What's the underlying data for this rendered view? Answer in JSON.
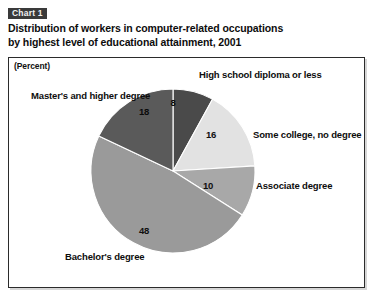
{
  "header": {
    "chart_number": "Chart 1",
    "title_line_1": "Distribution of workers in computer-related occupations",
    "title_line_2": "by highest level of educational attainment, 2001"
  },
  "plot": {
    "unit_label": "(Percent)"
  },
  "chart_data": {
    "type": "pie",
    "title": "Distribution of workers in computer-related occupations by highest level of educational attainment, 2001",
    "subtitle": "Chart 1",
    "unit": "(Percent)",
    "categories": [
      "High school diploma or less",
      "Some college, no degree",
      "Associate degree",
      "Bachelor's degree",
      "Master's and higher degree"
    ],
    "values": [
      8,
      16,
      10,
      48,
      18
    ],
    "value_labels": [
      "8",
      "16",
      "10",
      "48",
      "18"
    ],
    "colors": [
      "#4a4a4a",
      "#e2e2e2",
      "#a8a8a8",
      "#9a9a9a",
      "#5a5a5a"
    ],
    "start_angle_deg": 0,
    "direction": "clockwise",
    "total": 100,
    "legend": "none",
    "grid": false,
    "xlabel": "",
    "ylabel": ""
  },
  "labels": {
    "high_school": "High school diploma or less",
    "some_college": "Some college, no degree",
    "associate": "Associate degree",
    "bachelors": "Bachelor's degree",
    "masters": "Master's and higher degree"
  },
  "values": {
    "high_school": "8",
    "some_college": "16",
    "associate": "10",
    "bachelors": "48",
    "masters": "18"
  }
}
